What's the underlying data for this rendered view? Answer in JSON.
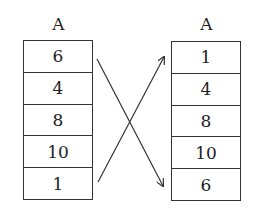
{
  "diagram": {
    "before": {
      "label": "A",
      "values": [
        "6",
        "4",
        "8",
        "10",
        "1"
      ]
    },
    "after": {
      "label": "A",
      "values": [
        "1",
        "4",
        "8",
        "10",
        "6"
      ]
    },
    "arrows": [
      {
        "from": "before[0]",
        "to": "after[4]",
        "meaning": "6 moves to last position"
      },
      {
        "from": "before[4]",
        "to": "after[0]",
        "meaning": "1 moves to first position"
      }
    ],
    "line_color": "#333333"
  }
}
